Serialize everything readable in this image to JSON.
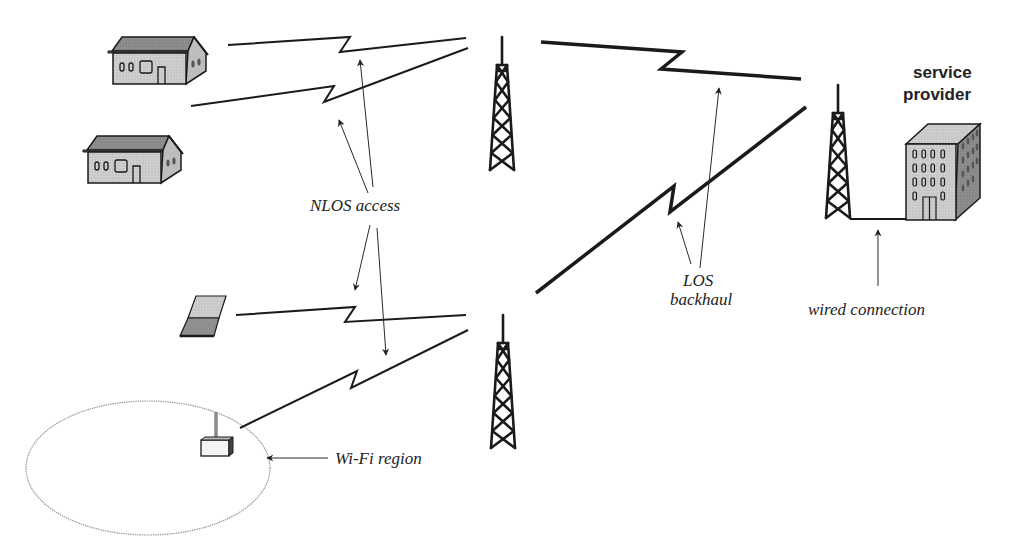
{
  "diagram": {
    "type": "wireless network topology",
    "labels": {
      "nlos_access": "NLOS access",
      "los_backhaul_line1": "LOS",
      "los_backhaul_line2": "backhaul",
      "service_provider_line1": "service",
      "service_provider_line2": "provider",
      "wired_connection": "wired connection",
      "wifi_region": "Wi-Fi region"
    },
    "nodes": [
      {
        "id": "house-1",
        "kind": "house-icon"
      },
      {
        "id": "house-2",
        "kind": "house-icon"
      },
      {
        "id": "laptop",
        "kind": "laptop-icon"
      },
      {
        "id": "wifi-access-point",
        "kind": "access-point-icon"
      },
      {
        "id": "tower-top",
        "kind": "tower-icon"
      },
      {
        "id": "tower-bottom",
        "kind": "tower-icon"
      },
      {
        "id": "tower-provider",
        "kind": "tower-icon"
      },
      {
        "id": "service-provider-building",
        "kind": "building-icon"
      }
    ],
    "links": [
      {
        "from": "house-1",
        "to": "tower-top",
        "type": "NLOS access"
      },
      {
        "from": "house-2",
        "to": "tower-top",
        "type": "NLOS access"
      },
      {
        "from": "laptop",
        "to": "tower-bottom",
        "type": "NLOS access"
      },
      {
        "from": "wifi-access-point",
        "to": "tower-bottom",
        "type": "NLOS access"
      },
      {
        "from": "tower-top",
        "to": "tower-provider",
        "type": "LOS backhaul"
      },
      {
        "from": "tower-bottom",
        "to": "tower-provider",
        "type": "LOS backhaul"
      },
      {
        "from": "tower-provider",
        "to": "service-provider-building",
        "type": "wired connection"
      }
    ],
    "colors": {
      "stroke": "#1a1a1a",
      "house_wall": "#d4d4d4",
      "house_roof": "#8c8c8c",
      "building_front": "#c8c8c8",
      "building_side": "#9a9a9a",
      "wifi_ellipse": "#9a9a9a"
    }
  }
}
